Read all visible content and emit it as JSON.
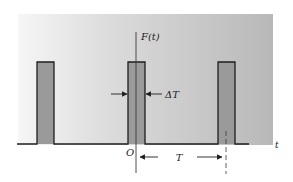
{
  "diagram": {
    "type": "periodic-rectangular-pulse-train",
    "labels": {
      "function": "F(t)",
      "time_axis": "t",
      "origin": "O",
      "pulse_width": "ΔT",
      "period": "T"
    },
    "colors": {
      "panel_light": "#f4f4f4",
      "panel_dark": "#b9b9b9",
      "pulse_fill": "#9a9a9a",
      "stroke": "#1e1e1e"
    },
    "pulses": [
      {
        "x_left": 37,
        "x_right": 54
      },
      {
        "x_left": 128,
        "x_right": 145
      },
      {
        "x_left": 218,
        "x_right": 235
      }
    ]
  }
}
